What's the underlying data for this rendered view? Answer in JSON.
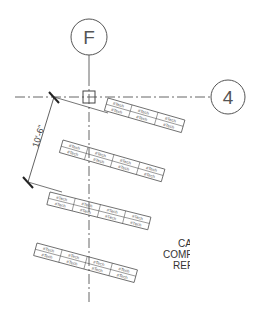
{
  "grid_bubbles": [
    {
      "label": "F",
      "cx": 89,
      "cy": 37,
      "r": 18
    },
    {
      "label": "4",
      "cx": 228,
      "cy": 97,
      "r": 17
    }
  ],
  "dimension": {
    "text": "10'-6\""
  },
  "tables": [
    {
      "name": "table-1",
      "rows": [
        [
          "#Tech",
          "#Tech",
          "#Tech"
        ],
        [
          "#Tech",
          "#Tech",
          "#Tech"
        ]
      ]
    },
    {
      "name": "table-2",
      "rows": [
        [
          "#Tech",
          "#Tech",
          "#Tech",
          "#Tech"
        ],
        [
          "#Tech",
          "#Tech",
          "#Tech",
          "#Tech"
        ]
      ]
    },
    {
      "name": "table-3",
      "rows": [
        [
          "#Tech",
          "#Tech",
          "#Tech",
          "#Tech"
        ],
        [
          "#Tech",
          "#Tech",
          "#Tech",
          "#Tech"
        ]
      ]
    },
    {
      "name": "table-4",
      "rows": [
        [
          "#Tech",
          "#Tech",
          "#Tech",
          "#Tech"
        ],
        [
          "#Tech",
          "#Tech",
          "#Tech",
          "#Tech"
        ]
      ]
    }
  ],
  "note": {
    "lines": [
      "CA",
      "COMP",
      "REF"
    ]
  },
  "colors": {
    "line": "#3a3a3a",
    "background": "#ffffff"
  }
}
